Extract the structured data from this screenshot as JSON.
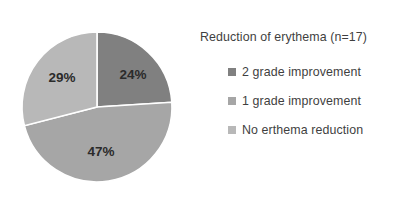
{
  "chart_data": {
    "type": "pie",
    "title": "Reduction of erythema (n=17)",
    "xlabel": "",
    "ylabel": "",
    "categories": [
      "2 grade improvement",
      "1 grade improvement",
      "No erthema reduction"
    ],
    "values": [
      24,
      47,
      29
    ],
    "value_labels": [
      "24%",
      "47%",
      "29%"
    ],
    "colors": [
      "#808080",
      "#a6a6a6",
      "#b8b8b8"
    ],
    "start_angle_deg": 0,
    "direction": "clockwise",
    "legend_position": "right",
    "grid": false,
    "separator_color": "#ffffff",
    "background": "#ffffff"
  },
  "legend": {
    "title": "Reduction of erythema (n=17)",
    "items": [
      {
        "label": "2 grade improvement",
        "color": "#808080"
      },
      {
        "label": "1 grade improvement",
        "color": "#a6a6a6"
      },
      {
        "label": "No erthema reduction",
        "color": "#b8b8b8"
      }
    ]
  },
  "pie": {
    "center_x": 97,
    "center_y": 107,
    "radius": 75,
    "slices": [
      {
        "name": "2 grade improvement",
        "percent": 24,
        "label": "24%",
        "color": "#808080",
        "label_x": 133,
        "label_y": 75
      },
      {
        "name": "1 grade improvement",
        "percent": 47,
        "label": "47%",
        "color": "#a6a6a6",
        "label_x": 101,
        "label_y": 152
      },
      {
        "name": "No erthema reduction",
        "percent": 29,
        "label": "29%",
        "color": "#b8b8b8",
        "label_x": 62,
        "label_y": 78
      }
    ]
  }
}
